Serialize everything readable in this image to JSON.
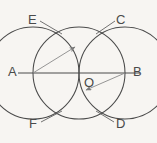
{
  "figure": {
    "background_color": "#f7f5f2",
    "stroke_color": "#4a4a4a",
    "arrow_color": "#7a7a7a",
    "label_color": "#4a4a4a",
    "points": {
      "A": {
        "label": "A",
        "x": 33,
        "y": 73,
        "label_x": 8,
        "label_y": 66
      },
      "B": {
        "label": "B",
        "x": 125,
        "y": 73,
        "label_x": 133,
        "label_y": 66
      },
      "O": {
        "label": "O",
        "x": 79,
        "y": 73,
        "label_x": 84,
        "label_y": 76
      },
      "E": {
        "label": "E",
        "x": 57,
        "y": 30,
        "label_x": 28,
        "label_y": 14
      },
      "C": {
        "label": "C",
        "x": 102,
        "y": 30,
        "label_x": 116,
        "label_y": 14
      },
      "F": {
        "label": "F",
        "x": 57,
        "y": 115,
        "label_x": 29,
        "label_y": 118
      },
      "D": {
        "label": "D",
        "x": 102,
        "y": 115,
        "label_x": 116,
        "label_y": 118
      }
    },
    "circles": [
      {
        "name": "main-circle-center-O",
        "cx": 79,
        "cy": 73,
        "r": 46
      },
      {
        "name": "arc-circle-center-A",
        "cx": 33,
        "cy": 73,
        "r": 46
      },
      {
        "name": "arc-circle-center-B",
        "cx": 125,
        "cy": 73,
        "r": 46
      }
    ],
    "lines": [
      {
        "name": "diameter-line-AB",
        "x1": 18,
        "y1": 73,
        "x2": 140,
        "y2": 73
      }
    ],
    "arrows": [
      {
        "name": "radius-arrow-from-A",
        "x1": 33,
        "y1": 73,
        "x2": 75,
        "y2": 47
      },
      {
        "name": "radius-arrow-from-B",
        "x1": 125,
        "y1": 73,
        "x2": 86,
        "y2": 90
      }
    ],
    "leaders": [
      {
        "name": "leader-E",
        "x1": 40,
        "y1": 21,
        "x2": 62,
        "y2": 34
      },
      {
        "name": "leader-C",
        "x1": 115,
        "y1": 21,
        "x2": 96,
        "y2": 34
      },
      {
        "name": "leader-F",
        "x1": 41,
        "y1": 122,
        "x2": 62,
        "y2": 111
      },
      {
        "name": "leader-D",
        "x1": 114,
        "y1": 122,
        "x2": 96,
        "y2": 111
      }
    ]
  }
}
